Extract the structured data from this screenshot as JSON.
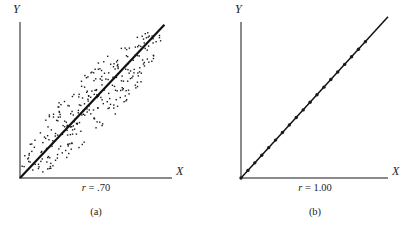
{
  "figure": {
    "background_color": "#ffffff",
    "axis_color": "#8a8a8a",
    "line_color": "#111111",
    "point_color": "#1a1a1a"
  },
  "panels": [
    {
      "id": "a",
      "caption": "(a)",
      "r_prefix": "r",
      "r_equals": " = ",
      "r_value": ".70",
      "r_label_full": "r = .70",
      "x_axis_label": "X",
      "y_axis_label": "Y"
    },
    {
      "id": "b",
      "caption": "(b)",
      "r_prefix": "r",
      "r_equals": " = ",
      "r_value": "1.00",
      "r_label_full": "r = 1.00",
      "x_axis_label": "X",
      "y_axis_label": "Y"
    }
  ],
  "chart_data": [
    {
      "type": "scatter",
      "title": "r = .70",
      "subtitle": "(a)",
      "xlabel": "X",
      "ylabel": "Y",
      "correlation": 0.7,
      "grid": false,
      "legend": false,
      "axis_ticks": false,
      "xlim": [
        0,
        1
      ],
      "ylim": [
        0,
        1
      ],
      "regression_line": {
        "description": "straight line from origin to upper right",
        "x": [
          0.0,
          0.95
        ],
        "y": [
          0.0,
          0.97
        ],
        "width_px": 2.2,
        "color": "#111111"
      },
      "point_count": 300,
      "point_marker": "square",
      "point_size_px": 1.4,
      "cloud_shape": "tilted ellipse aligned with regression line",
      "cloud_center": [
        0.47,
        0.47
      ],
      "cloud_semi_major": 0.63,
      "cloud_semi_minor": 0.16,
      "cloud_angle_deg": 45,
      "x": [
        0.055,
        0.085,
        0.065,
        0.12,
        0.09,
        0.14,
        0.045,
        0.1,
        0.17,
        0.13,
        0.2,
        0.16,
        0.105,
        0.23,
        0.19,
        0.15,
        0.26,
        0.22,
        0.175,
        0.29,
        0.25,
        0.205,
        0.32,
        0.28,
        0.235,
        0.35,
        0.31,
        0.265,
        0.38,
        0.34,
        0.295,
        0.41,
        0.37,
        0.325,
        0.44,
        0.4,
        0.355,
        0.47,
        0.43,
        0.385,
        0.5,
        0.46,
        0.415,
        0.53,
        0.49,
        0.445,
        0.56,
        0.52,
        0.475,
        0.59,
        0.55,
        0.505,
        0.62,
        0.58,
        0.535,
        0.65,
        0.61,
        0.565,
        0.68,
        0.64,
        0.595,
        0.71,
        0.67,
        0.625,
        0.74,
        0.7,
        0.655,
        0.77,
        0.73,
        0.685,
        0.8,
        0.76,
        0.715,
        0.83,
        0.79,
        0.745,
        0.86,
        0.82,
        0.775,
        0.89,
        0.07,
        0.11,
        0.155,
        0.2,
        0.245,
        0.29,
        0.335,
        0.38,
        0.425,
        0.47,
        0.515,
        0.56,
        0.605,
        0.65,
        0.695,
        0.74,
        0.785,
        0.83,
        0.875,
        0.9
      ],
      "y": [
        0.04,
        0.13,
        0.09,
        0.07,
        0.17,
        0.11,
        0.1,
        0.19,
        0.14,
        0.22,
        0.16,
        0.25,
        0.21,
        0.18,
        0.28,
        0.24,
        0.2,
        0.31,
        0.27,
        0.23,
        0.34,
        0.3,
        0.26,
        0.37,
        0.33,
        0.29,
        0.4,
        0.36,
        0.32,
        0.43,
        0.39,
        0.35,
        0.46,
        0.42,
        0.38,
        0.49,
        0.45,
        0.41,
        0.52,
        0.48,
        0.44,
        0.55,
        0.51,
        0.47,
        0.58,
        0.54,
        0.5,
        0.61,
        0.57,
        0.53,
        0.64,
        0.6,
        0.56,
        0.67,
        0.63,
        0.59,
        0.7,
        0.66,
        0.62,
        0.73,
        0.69,
        0.65,
        0.76,
        0.72,
        0.68,
        0.79,
        0.75,
        0.71,
        0.82,
        0.78,
        0.74,
        0.85,
        0.81,
        0.77,
        0.88,
        0.84,
        0.8,
        0.91,
        0.87,
        0.83,
        0.02,
        0.06,
        0.1,
        0.15,
        0.19,
        0.24,
        0.28,
        0.33,
        0.37,
        0.42,
        0.46,
        0.51,
        0.55,
        0.6,
        0.64,
        0.69,
        0.73,
        0.78,
        0.82,
        0.93
      ]
    },
    {
      "type": "scatter",
      "title": "r = 1.00",
      "subtitle": "(b)",
      "xlabel": "X",
      "ylabel": "Y",
      "correlation": 1.0,
      "grid": false,
      "legend": false,
      "axis_ticks": false,
      "xlim": [
        0,
        1
      ],
      "ylim": [
        0,
        1
      ],
      "regression_line": {
        "description": "straight line from origin to upper right, all points lie exactly on it",
        "x": [
          0.0,
          1.0
        ],
        "y": [
          0.0,
          1.02
        ],
        "width_px": 1.5,
        "color": "#111111"
      },
      "point_count": 19,
      "point_marker": "circle",
      "point_size_px": 3.4,
      "x": [
        0.0,
        0.047,
        0.094,
        0.141,
        0.188,
        0.235,
        0.282,
        0.329,
        0.376,
        0.423,
        0.47,
        0.517,
        0.564,
        0.611,
        0.658,
        0.705,
        0.752,
        0.799,
        0.846
      ],
      "y": [
        0.0,
        0.048,
        0.096,
        0.144,
        0.192,
        0.24,
        0.288,
        0.336,
        0.383,
        0.431,
        0.479,
        0.527,
        0.575,
        0.623,
        0.671,
        0.719,
        0.767,
        0.815,
        0.863
      ]
    }
  ]
}
